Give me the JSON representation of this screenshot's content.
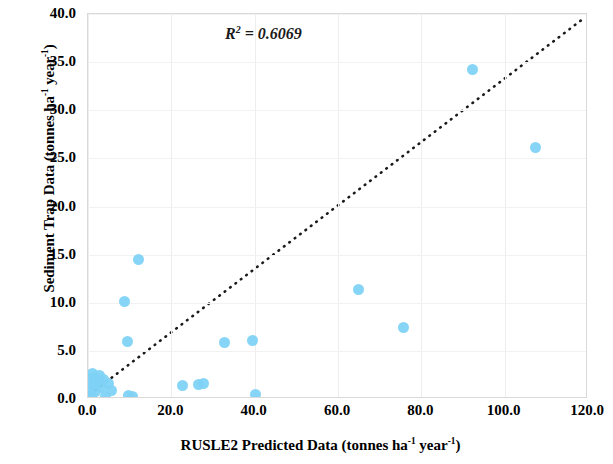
{
  "chart_data": {
    "type": "scatter",
    "title": "",
    "xlabel": "RUSLE2 Predicted Data (tonnes ha-1 year-1)",
    "xlabel_prefix": "RUSLE2 Predicted Data (tonnes ha",
    "xlabel_sup1": "-1",
    "xlabel_mid": " year",
    "xlabel_sup2": "-1",
    "xlabel_suffix": ")",
    "ylabel": "Sediment Trap Data (tonnes ha-1 year-1)",
    "ylabel_prefix": "Sediment Trap Data (tonnes ha",
    "ylabel_sup1": "-1",
    "ylabel_mid": " year",
    "ylabel_sup2": "-1",
    "ylabel_suffix": ")",
    "xlim": [
      0,
      120
    ],
    "ylim": [
      0,
      40
    ],
    "xticks": [
      "0.0",
      "20.0",
      "40.0",
      "60.0",
      "80.0",
      "100.0",
      "120.0"
    ],
    "xtick_values": [
      0,
      20,
      40,
      60,
      80,
      100,
      120
    ],
    "yticks": [
      "0.0",
      "5.0",
      "10.0",
      "15.0",
      "20.0",
      "25.0",
      "30.0",
      "35.0",
      "40.0"
    ],
    "ytick_values": [
      0,
      5,
      10,
      15,
      20,
      25,
      30,
      35,
      40
    ],
    "grid": true,
    "legend": false,
    "marker_color": "#7ed2f5",
    "trendline": {
      "style": "dotted",
      "color": "#1a1a1a",
      "x0": 0.5,
      "y0": 0.3,
      "x1": 119.0,
      "y1": 39.4
    },
    "annotations": [
      {
        "name": "r-squared",
        "text": "R2 = 0.6069",
        "prefix": "R",
        "sup": "2",
        "suffix": " = 0.6069",
        "x": 46,
        "y": 37.2
      }
    ],
    "points": [
      {
        "x": 0.4,
        "y": 1.0
      },
      {
        "x": 0.6,
        "y": 2.0
      },
      {
        "x": 0.8,
        "y": 0.4
      },
      {
        "x": 1.0,
        "y": 2.6
      },
      {
        "x": 1.3,
        "y": 1.5
      },
      {
        "x": 1.6,
        "y": 2.2
      },
      {
        "x": 1.9,
        "y": 0.8
      },
      {
        "x": 2.3,
        "y": 1.8
      },
      {
        "x": 2.8,
        "y": 2.4
      },
      {
        "x": 3.2,
        "y": 1.2
      },
      {
        "x": 3.6,
        "y": 2.0
      },
      {
        "x": 4.2,
        "y": 0.3
      },
      {
        "x": 5.0,
        "y": 1.6
      },
      {
        "x": 5.6,
        "y": 0.9
      },
      {
        "x": 8.7,
        "y": 10.1
      },
      {
        "x": 9.5,
        "y": 6.0
      },
      {
        "x": 9.8,
        "y": 0.4
      },
      {
        "x": 10.6,
        "y": 0.3
      },
      {
        "x": 12.2,
        "y": 14.5
      },
      {
        "x": 22.6,
        "y": 1.4
      },
      {
        "x": 26.4,
        "y": 1.5
      },
      {
        "x": 27.6,
        "y": 1.6
      },
      {
        "x": 32.8,
        "y": 5.9
      },
      {
        "x": 39.5,
        "y": 6.1
      },
      {
        "x": 40.2,
        "y": 0.5
      },
      {
        "x": 65.0,
        "y": 11.4
      },
      {
        "x": 75.6,
        "y": 7.4
      },
      {
        "x": 92.2,
        "y": 34.2
      },
      {
        "x": 107.3,
        "y": 26.1
      }
    ]
  }
}
